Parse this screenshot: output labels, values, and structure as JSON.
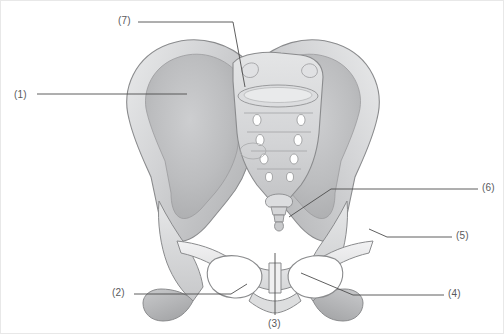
{
  "figure": {
    "background_color": "#ffffff",
    "border_color": "#e8e8e8",
    "label_color": "#58595b",
    "leader_line_color": "#4d4d4d",
    "bone_fill_light": "#ececed",
    "bone_fill_mid": "#d8d9da",
    "bone_fill_dark": "#b9babc",
    "bone_fill_shadow": "#a3a4a6",
    "bone_outline": "#8a8b8d"
  },
  "labels": [
    {
      "id": "1",
      "text": "(1)",
      "x": 13,
      "y": 89,
      "target": "left-ilium-iliac-fossa"
    },
    {
      "id": "2",
      "text": "(2)",
      "x": 111,
      "y": 287,
      "target": "left-ischium"
    },
    {
      "id": "3",
      "text": "(3)",
      "x": 267,
      "y": 318,
      "target": "pubic-symphysis"
    },
    {
      "id": "4",
      "text": "(4)",
      "x": 447,
      "y": 288,
      "target": "right-inferior-pubic-ramus"
    },
    {
      "id": "5",
      "text": "(5)",
      "x": 455,
      "y": 230,
      "target": "right-acetabulum"
    },
    {
      "id": "6",
      "text": "(6)",
      "x": 481,
      "y": 182,
      "target": "coccyx"
    },
    {
      "id": "7",
      "text": "(7)",
      "x": 117,
      "y": 15,
      "target": "sacral-ala-sacroiliac-joint"
    }
  ],
  "anatomy": {
    "parts": [
      "left-ilium",
      "right-ilium",
      "sacrum",
      "coccyx",
      "left-obturator-foramen",
      "right-obturator-foramen",
      "pubic-symphysis",
      "left-ischium",
      "right-ischium",
      "sacral-foramina"
    ]
  }
}
